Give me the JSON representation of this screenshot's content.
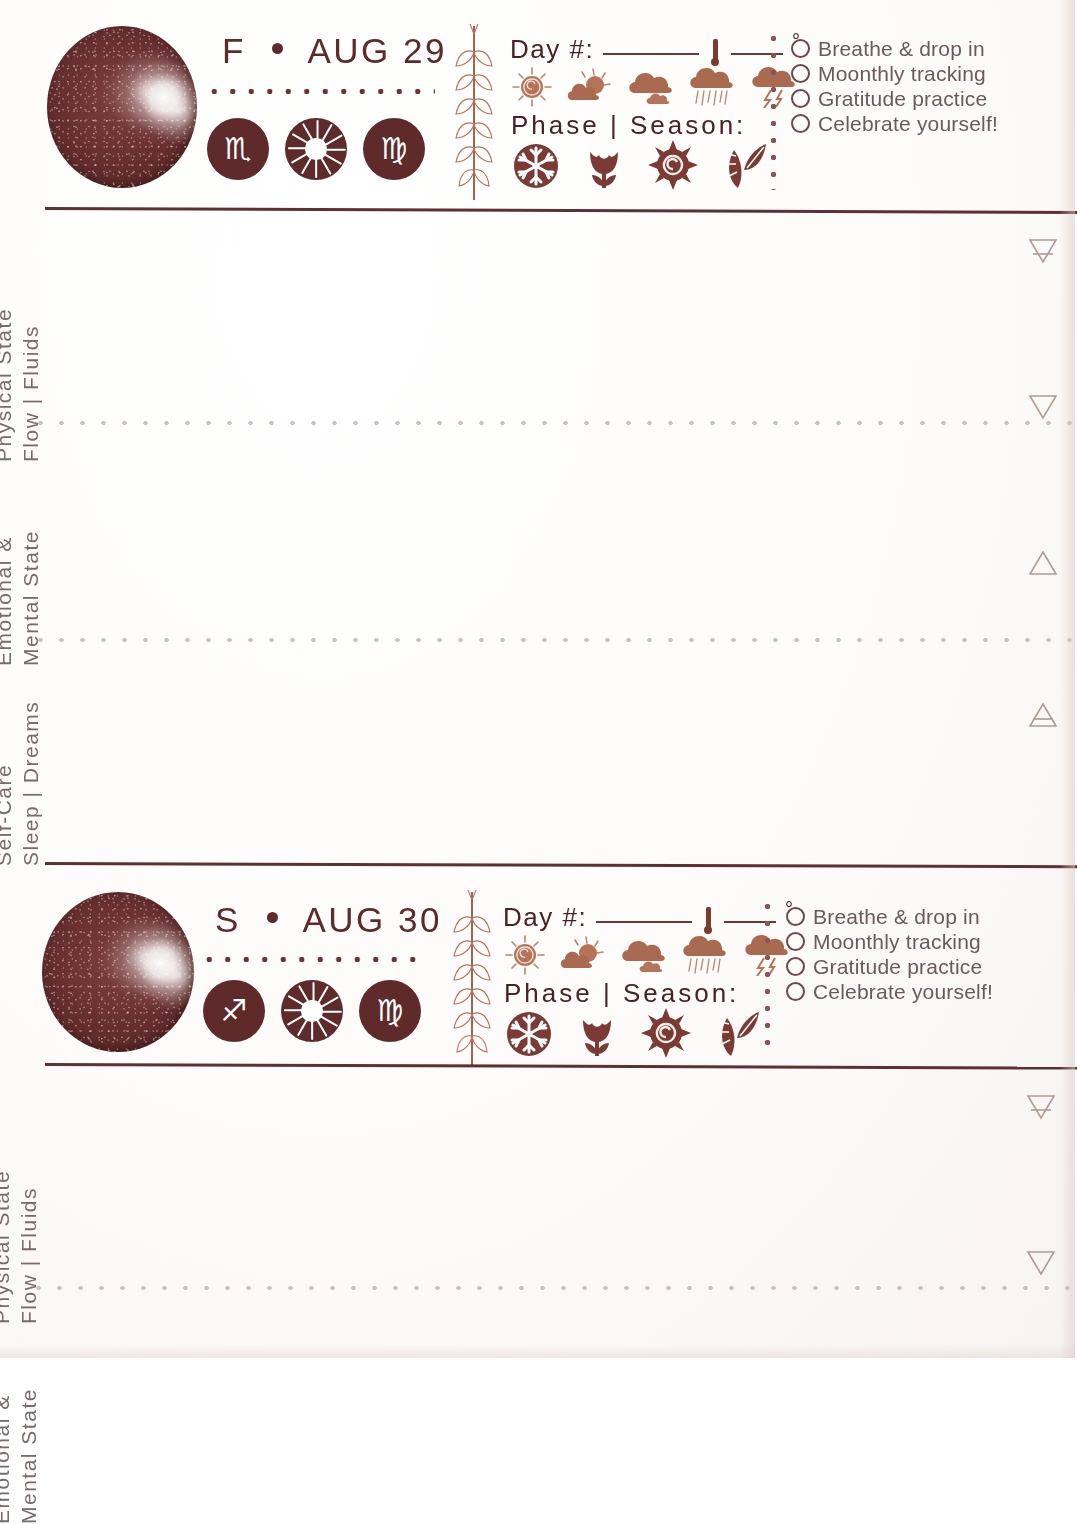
{
  "document": {
    "kind": "moon-phase daily journal spread",
    "accent_dark": "#5e2a2a",
    "accent_mid": "#7a3b30",
    "accent_light": "#b8715a",
    "ink_grey": "#7a6a6a",
    "paper": "#fdfcfb"
  },
  "days": [
    {
      "weekday": "F",
      "separator": "•",
      "date": "AUG 29",
      "moon": {
        "name": "waning-gibbous-moon",
        "illumination_side": "right"
      },
      "badges": [
        {
          "name": "moon-sign-scorpio",
          "glyph": "♏",
          "label": "Scorpio"
        },
        {
          "name": "sun-icon",
          "glyph": "",
          "label": "Sun"
        },
        {
          "name": "sun-sign-virgo",
          "glyph": "♍",
          "label": "Virgo"
        }
      ],
      "day_number_label": "Day #:",
      "degree_symbol": "°",
      "phase_season_label": "Phase | Season:",
      "weather_icons": [
        "sunny-icon",
        "partly-cloudy-icon",
        "cloudy-icon",
        "rainy-icon",
        "stormy-icon"
      ],
      "season_icons": [
        "winter-snowflake-icon",
        "spring-tulip-icon",
        "summer-sun-spiral-icon",
        "autumn-leaves-icon"
      ],
      "checklist": [
        "Breathe & drop in",
        "Moonthly tracking",
        "Gratitude practice",
        "Celebrate yourself!"
      ],
      "sections": [
        {
          "line1": "Physical State",
          "line2": "Flow | Fluids",
          "element": "earth-symbol"
        },
        {
          "line1": "Emotional &",
          "line2": "Mental State",
          "element": "water-symbol"
        },
        {
          "line1": "Self-Care",
          "line2": "Sleep | Dreams",
          "element": "fire-symbol"
        }
      ],
      "trailing_element": "air-symbol"
    },
    {
      "weekday": "S",
      "separator": "•",
      "date": "AUG 30",
      "moon": {
        "name": "waning-gibbous-moon",
        "illumination_side": "right"
      },
      "badges": [
        {
          "name": "moon-sign-sagittarius",
          "glyph": "♐",
          "label": "Sagittarius"
        },
        {
          "name": "sun-icon",
          "glyph": "",
          "label": "Sun"
        },
        {
          "name": "sun-sign-virgo",
          "glyph": "♍",
          "label": "Virgo"
        }
      ],
      "day_number_label": "Day #:",
      "degree_symbol": "°",
      "phase_season_label": "Phase | Season:",
      "weather_icons": [
        "sunny-icon",
        "partly-cloudy-icon",
        "cloudy-icon",
        "rainy-icon",
        "stormy-icon"
      ],
      "season_icons": [
        "winter-snowflake-icon",
        "spring-tulip-icon",
        "summer-sun-spiral-icon",
        "autumn-leaves-icon"
      ],
      "checklist": [
        "Breathe & drop in",
        "Moonthly tracking",
        "Gratitude practice",
        "Celebrate yourself!"
      ],
      "sections": [
        {
          "line1": "Physical State",
          "line2": "Flow | Fluids",
          "element": "earth-symbol"
        },
        {
          "line1": "Emotional &",
          "line2": "Mental State",
          "element": "water-symbol"
        }
      ],
      "trailing_element": ""
    }
  ]
}
